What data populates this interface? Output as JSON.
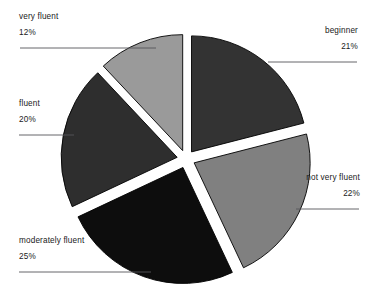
{
  "chart_data": {
    "type": "pie",
    "title": "",
    "subtitle": "",
    "xlabel": "",
    "ylabel": "",
    "legend_position": "none",
    "grid": false,
    "exploded": true,
    "start_angle_deg": 0,
    "direction": "clockwise",
    "categories": [
      "beginner",
      "not very fluent",
      "moderately fluent",
      "fluent",
      "very fluent"
    ],
    "values": [
      21,
      22,
      25,
      20,
      12
    ],
    "value_unit": "%",
    "colors": [
      "#333333",
      "#808080",
      "#0d0d0d",
      "#2e2e2e",
      "#9a9a9a"
    ],
    "slice_outline_color": "#000000",
    "background": "#ffffff",
    "slices": [
      {
        "label": "beginner",
        "value": 21,
        "value_text": "21%",
        "color": "#333333",
        "side": "right"
      },
      {
        "label": "not very fluent",
        "value": 22,
        "value_text": "22%",
        "color": "#808080",
        "side": "right"
      },
      {
        "label": "moderately fluent",
        "value": 25,
        "value_text": "25%",
        "color": "#0d0d0d",
        "side": "left"
      },
      {
        "label": "fluent",
        "value": 20,
        "value_text": "20%",
        "color": "#2e2e2e",
        "side": "left"
      },
      {
        "label": "very fluent",
        "value": 12,
        "value_text": "12%",
        "color": "#9a9a9a",
        "side": "left"
      }
    ]
  },
  "callouts": {
    "very_fluent": {
      "category": "very fluent",
      "percent": "12%"
    },
    "fluent": {
      "category": "fluent",
      "percent": "20%"
    },
    "moderately_fluent": {
      "category": "moderately fluent",
      "percent": "25%"
    },
    "beginner": {
      "category": "beginner",
      "percent": "21%"
    },
    "not_very_fluent": {
      "category": "not very fluent",
      "percent": "22%"
    }
  }
}
